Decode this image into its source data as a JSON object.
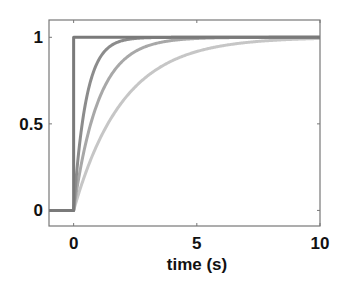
{
  "chart_data": {
    "type": "line",
    "title": "",
    "xlabel": "time (s)",
    "ylabel": "",
    "xlim": [
      -1,
      10
    ],
    "ylim": [
      -0.09,
      1.1
    ],
    "xticks": [
      0,
      5,
      10
    ],
    "xtick_labels": [
      "0",
      "5",
      "10"
    ],
    "yticks": [
      0,
      0.5,
      1
    ],
    "ytick_labels": [
      "0",
      "0.5",
      "1"
    ],
    "grid": false,
    "legend": null,
    "series": [
      {
        "name": "step",
        "tau": 0,
        "color": "#7a7a7a",
        "description": "instantaneous step from 0 to 1 at t=0"
      },
      {
        "name": "tau_0.5",
        "tau": 0.5,
        "color": "#8c8c8c",
        "description": "1 - exp(-t/0.5)"
      },
      {
        "name": "tau_1",
        "tau": 1.0,
        "color": "#a8a8a8",
        "description": "1 - exp(-t/1)"
      },
      {
        "name": "tau_2",
        "tau": 2.0,
        "color": "#c6c6c6",
        "description": "1 - exp(-t/2)"
      }
    ],
    "sample_points": {
      "x": [
        -1,
        0,
        0.5,
        1,
        2,
        3,
        5,
        10
      ],
      "step": [
        0,
        1,
        1,
        1,
        1,
        1,
        1,
        1
      ],
      "tau_0.5": [
        0,
        0,
        0.632,
        0.865,
        0.982,
        0.998,
        1.0,
        1.0
      ],
      "tau_1": [
        0,
        0,
        0.393,
        0.632,
        0.865,
        0.95,
        0.993,
        1.0
      ],
      "tau_2": [
        0,
        0,
        0.221,
        0.393,
        0.632,
        0.777,
        0.918,
        0.993
      ]
    }
  }
}
